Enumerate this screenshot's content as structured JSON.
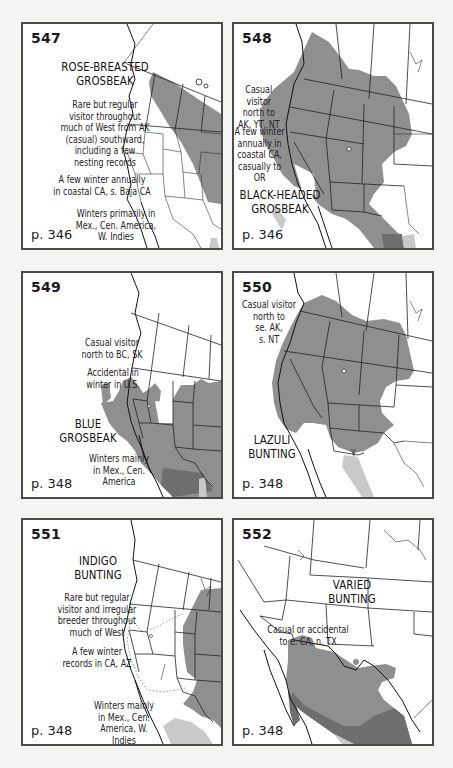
{
  "page": {
    "background": "#f5f5f4",
    "colors": {
      "summer_range": "#8f8f8f",
      "year_round_range": "#6e6e6e",
      "winter_range": "#c9c9c9",
      "border": "#4a4a4a"
    }
  },
  "maps": [
    {
      "number": "547",
      "title_lines": [
        "ROSE-BREASTED",
        "GROSBEAK"
      ],
      "notes": [
        "Rare but regular visitor throughout much of West from AK (casual) southward, including a few nesting records",
        "A few winter annually in coastal CA, s. Baja CA",
        "Winters primarily in Mex., Cen. America, W. Indies"
      ],
      "page_ref": "p. 346"
    },
    {
      "number": "548",
      "title_lines": [
        "BLACK-HEADED",
        "GROSBEAK"
      ],
      "notes": [
        "Casual visitor north to AK, YT, NT",
        "A few winter annually in coastal CA, casually to OR"
      ],
      "page_ref": "p. 346"
    },
    {
      "number": "549",
      "title_lines": [
        "BLUE",
        "GROSBEAK"
      ],
      "notes": [
        "Casual visitor north to BC, SK",
        "Accidental in winter in U.S.",
        "Winters mainly in Mex., Cen. America"
      ],
      "page_ref": "p. 348"
    },
    {
      "number": "550",
      "title_lines": [
        "LAZULI",
        "BUNTING"
      ],
      "notes": [
        "Casual visitor north to se. AK, s. NT"
      ],
      "page_ref": "p. 348"
    },
    {
      "number": "551",
      "title_lines": [
        "INDIGO",
        "BUNTING"
      ],
      "notes": [
        "Rare but regular visitor and irregular breeder throughout much of West",
        "A few winter records in CA, AZ",
        "Winters mainly in Mex., Cen. America, W. Indies"
      ],
      "page_ref": "p. 348"
    },
    {
      "number": "552",
      "title_lines": [
        "VARIED",
        "BUNTING"
      ],
      "notes": [
        "Casual or accidental to e. CA, n. TX"
      ],
      "page_ref": "p. 348"
    }
  ],
  "display": {
    "m547": {
      "t1": "ROSE-BREASTED",
      "t2": "GROSBEAK",
      "n1": [
        "Rare but regular",
        "visitor throughout",
        "much of West from AK",
        "(casual) southward,",
        "including a few",
        "nesting records"
      ],
      "n2": [
        "A few winter annually",
        "in coastal CA, s. Baja CA"
      ],
      "n3": [
        "Winters primarily in",
        "Mex., Cen. America,",
        "W. Indies"
      ]
    },
    "m548": {
      "t1": "BLACK-HEADED",
      "t2": "GROSBEAK",
      "n1": [
        "Casual visitor",
        "north to",
        "AK, YT, NT"
      ],
      "n2": [
        "A few winter",
        "annually in",
        "coastal CA,",
        "casually to OR"
      ]
    },
    "m549": {
      "t1": "BLUE",
      "t2": "GROSBEAK",
      "n1": [
        "Casual visitor",
        "north to BC, SK"
      ],
      "n2": [
        "Accidental in",
        "winter in U.S."
      ],
      "n3": [
        "Winters mainly",
        "in Mex., Cen.",
        "America"
      ]
    },
    "m550": {
      "t1": "LAZULI",
      "t2": "BUNTING",
      "n1": [
        "Casual visitor",
        "north to",
        "se. AK,",
        "s. NT"
      ]
    },
    "m551": {
      "t1": "INDIGO",
      "t2": "BUNTING",
      "n1": [
        "Rare but regular",
        "visitor and irregular",
        "breeder throughout",
        "much of West"
      ],
      "n2": [
        "A few winter",
        "records in CA, AZ"
      ],
      "n3": [
        "Winters mainly",
        "in Mex., Cen.",
        "America, W. Indies"
      ]
    },
    "m552": {
      "t1": "VARIED",
      "t2": "BUNTING",
      "n1": [
        "Casual or accidental",
        "to e. CA, n. TX"
      ]
    }
  }
}
